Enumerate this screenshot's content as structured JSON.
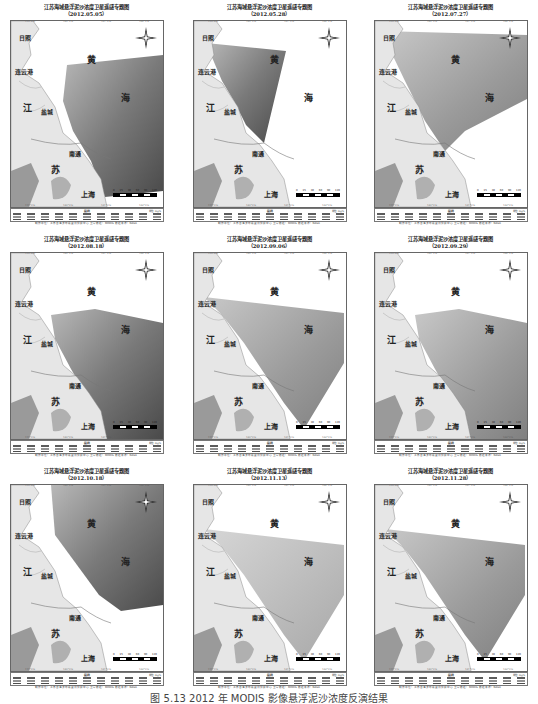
{
  "figure": {
    "caption": "图 5.13   2012 年 MODIS 影像悬浮泥沙浓度反演结果",
    "panels": [
      {
        "title": "江苏海域悬浮泥沙浓度卫星遥感专题图",
        "date": "（2012.05.05）",
        "coverage": "east",
        "tone": "dark"
      },
      {
        "title": "江苏海域悬浮泥沙浓度卫星遥感专题图",
        "date": "（2012.05.28）",
        "coverage": "north",
        "tone": "dark"
      },
      {
        "title": "江苏海域悬浮泥沙浓度卫星遥感专题图",
        "date": "（2012.07.27）",
        "coverage": "north-wide",
        "tone": "mixed"
      },
      {
        "title": "江苏海域悬浮泥沙浓度卫星遥感专题图",
        "date": "（2012.08.18）",
        "coverage": "south",
        "tone": "dark"
      },
      {
        "title": "江苏海域悬浮泥沙浓度卫星遥感专题图",
        "date": "（2012.09.06）",
        "coverage": "center",
        "tone": "mixed"
      },
      {
        "title": "江苏海域悬浮泥沙浓度卫星遥感专题图",
        "date": "（2012.09.29）",
        "coverage": "south",
        "tone": "mixed"
      },
      {
        "title": "江苏海域悬浮泥沙浓度卫星遥感专题图",
        "date": "（2012.10.18）",
        "coverage": "full",
        "tone": "dark"
      },
      {
        "title": "江苏海域悬浮泥沙浓度卫星遥感专题图",
        "date": "（2012.11.13）",
        "coverage": "center",
        "tone": "light"
      },
      {
        "title": "江苏海域悬浮泥沙浓度卫星遥感专题图",
        "date": "（2012.11.28）",
        "coverage": "center",
        "tone": "mixed"
      }
    ],
    "map_labels": {
      "rizhao": "日照",
      "lianyungang": "连云港",
      "jiang": "江",
      "su": "苏",
      "yancheng": "盐城",
      "nantong": "南通",
      "shanghai": "上海",
      "huang": "黄",
      "hai": "海"
    },
    "scale_bar": [
      "0",
      "15",
      "30",
      "60",
      "90",
      "120"
    ],
    "legend": {
      "title": "图 例",
      "unit": "单位：mg/L"
    },
    "ticks": [
      "119°0'E",
      "120°0'E",
      "121°0'E",
      "122°0'E"
    ],
    "note": "制作单位：江苏省海洋环境监测预报中心  卫星数据：MODIS  数据来源：NASA"
  }
}
